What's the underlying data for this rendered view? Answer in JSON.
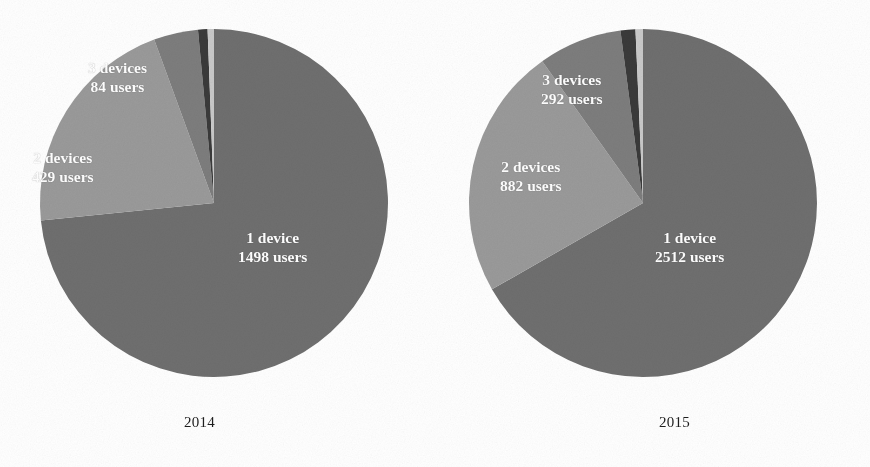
{
  "figure": {
    "background_color": "#ffffff",
    "panels": [
      {
        "id": "panel-2014",
        "year_caption": "2014",
        "slices": [
          {
            "name": "1 device",
            "label_line1": "1 device",
            "label_line2": "1498 users",
            "users": 1498,
            "color": "#6f6f6f"
          },
          {
            "name": "2 devices",
            "label_line1": "2 devices",
            "label_line2": "429 users",
            "users": 429,
            "color": "#9a9a9a"
          },
          {
            "name": "3 devices",
            "label_line1": "3 devices",
            "label_line2": "84 users",
            "users": 84,
            "color": "#7d7d7d"
          },
          {
            "name": "4 devices",
            "label_line1": "",
            "label_line2": "",
            "users": 18,
            "color": "#3a3a3a"
          },
          {
            "name": "5 devices",
            "label_line1": "",
            "label_line2": "",
            "users": 12,
            "color": "#c9c9c9"
          }
        ]
      },
      {
        "id": "panel-2015",
        "year_caption": "2015",
        "slices": [
          {
            "name": "1 device",
            "label_line1": "1 device",
            "label_line2": "2512 users",
            "users": 2512,
            "color": "#6f6f6f"
          },
          {
            "name": "2 devices",
            "label_line1": "2 devices",
            "label_line2": "882 users",
            "users": 882,
            "color": "#9a9a9a"
          },
          {
            "name": "3 devices",
            "label_line1": "3 devices",
            "label_line2": "292 users",
            "users": 292,
            "color": "#7d7d7d"
          },
          {
            "name": "4 devices",
            "label_line1": "",
            "label_line2": "",
            "users": 52,
            "color": "#3a3a3a"
          },
          {
            "name": "5 devices",
            "label_line1": "",
            "label_line2": "",
            "users": 26,
            "color": "#c9c9c9"
          }
        ]
      }
    ]
  },
  "chart_data": [
    {
      "type": "pie",
      "title": "2014",
      "xlabel": "",
      "ylabel": "",
      "legend_position": "none",
      "grid": false,
      "labels": [
        "1 device",
        "2 devices",
        "3 devices",
        "4 devices",
        "5 devices"
      ],
      "values": [
        1498,
        429,
        84,
        18,
        12
      ],
      "value_unit": "users",
      "data_labels": [
        "1 device\n1498 users",
        "2 devices\n429 users",
        "3 devices\n84 users",
        "",
        ""
      ],
      "colors": [
        "#6f6f6f",
        "#9a9a9a",
        "#7d7d7d",
        "#3a3a3a",
        "#c9c9c9"
      ],
      "start_angle_deg": 0,
      "direction": "clockwise",
      "annotations": [
        "2014"
      ]
    },
    {
      "type": "pie",
      "title": "2015",
      "xlabel": "",
      "ylabel": "",
      "legend_position": "none",
      "grid": false,
      "labels": [
        "1 device",
        "2 devices",
        "3 devices",
        "4 devices",
        "5 devices"
      ],
      "values": [
        2512,
        882,
        292,
        52,
        26
      ],
      "value_unit": "users",
      "data_labels": [
        "1 device\n2512 users",
        "2 devices\n882 users",
        "3 devices\n292 users",
        "",
        ""
      ],
      "colors": [
        "#6f6f6f",
        "#9a9a9a",
        "#7d7d7d",
        "#3a3a3a",
        "#c9c9c9"
      ],
      "start_angle_deg": 0,
      "direction": "clockwise",
      "annotations": [
        "2015"
      ]
    }
  ]
}
